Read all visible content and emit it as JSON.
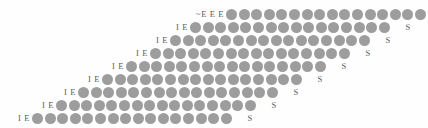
{
  "figure": {
    "title": "",
    "background_color": "#fefefe",
    "dot_color": "#9d9d9d",
    "label_color": "#5c5c5c",
    "dot_diameter_px": 11,
    "row_count": 9
  },
  "rows": [
    {
      "left_label": "~E E E",
      "dot_count": 16,
      "right_label": "",
      "x": 196,
      "y": 8,
      "right_gap_px": 0
    },
    {
      "left_label": "I E",
      "dot_count": 16,
      "right_label": "S",
      "x": 176,
      "y": 21,
      "right_gap_px": 14
    },
    {
      "left_label": "I E",
      "dot_count": 16,
      "right_label": "S",
      "x": 156,
      "y": 34,
      "right_gap_px": 14
    },
    {
      "left_label": "I E",
      "dot_count": 16,
      "right_label": "S",
      "x": 136,
      "y": 47,
      "right_gap_px": 14
    },
    {
      "left_label": "I E",
      "dot_count": 16,
      "right_label": "S",
      "x": 112,
      "y": 60,
      "right_gap_px": 14
    },
    {
      "left_label": "I E",
      "dot_count": 16,
      "right_label": "S",
      "x": 88,
      "y": 73,
      "right_gap_px": 14
    },
    {
      "left_label": "I E",
      "dot_count": 16,
      "right_label": "S",
      "x": 64,
      "y": 86,
      "right_gap_px": 14
    },
    {
      "left_label": "I E",
      "dot_count": 16,
      "right_label": "S",
      "x": 42,
      "y": 99,
      "right_gap_px": 14
    },
    {
      "left_label": "I E",
      "dot_count": 16,
      "right_label": "S",
      "x": 18,
      "y": 112,
      "right_gap_px": 14
    }
  ]
}
